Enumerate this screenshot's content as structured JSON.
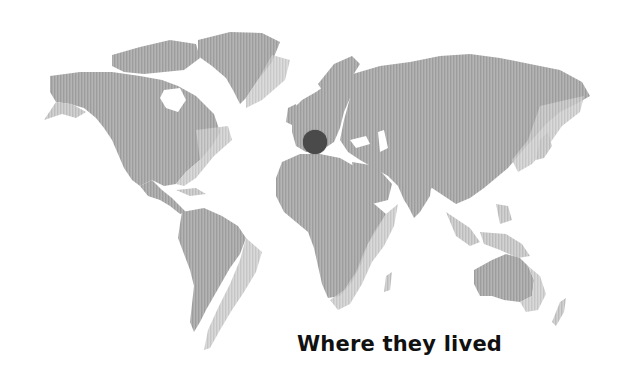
{
  "caption": "Where they lived",
  "map": {
    "land_color": "#a6a6a6",
    "land_stripe_color": "#bdbdbd",
    "shadow_color": "#cfcfcf",
    "background": "#ffffff"
  },
  "marker": {
    "label": "location-marker",
    "region": "Europe (southern France / northern Italy)",
    "x": 315,
    "y": 142,
    "radius": 12,
    "color": "#4a4a4a"
  }
}
